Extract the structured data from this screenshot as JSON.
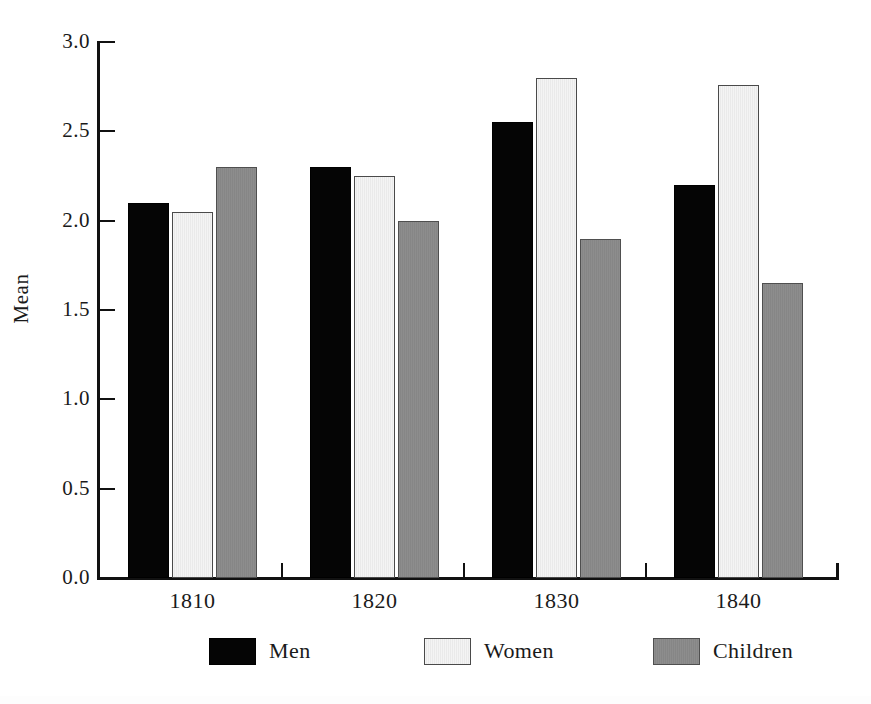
{
  "chart_data": {
    "type": "bar",
    "title": "",
    "subtitle": "",
    "xlabel": "",
    "ylabel": "Mean",
    "categories": [
      "1810",
      "1820",
      "1830",
      "1840"
    ],
    "series": [
      {
        "name": "Men",
        "values": [
          2.1,
          2.3,
          2.55,
          2.2
        ],
        "color": "#050505"
      },
      {
        "name": "Women",
        "values": [
          2.05,
          2.25,
          2.8,
          2.76
        ],
        "color": "#f2f2f2"
      },
      {
        "name": "Children",
        "values": [
          2.3,
          2.0,
          1.9,
          1.65
        ],
        "color": "#8a8a8a"
      }
    ],
    "ylim": [
      0.0,
      3.0
    ],
    "ytick_labels": [
      "0.0",
      "0.5",
      "1.0",
      "1.5",
      "2.0",
      "2.5",
      "3.0"
    ],
    "ytick_values": [
      0.0,
      0.5,
      1.0,
      1.5,
      2.0,
      2.5,
      3.0
    ],
    "grid": false,
    "legend_position": "bottom",
    "legend_entries": [
      "Men",
      "Women",
      "Children"
    ]
  },
  "axis": {
    "y_title": "Mean",
    "ticks": [
      {
        "label": "3.0",
        "value": 3.0
      },
      {
        "label": "2.5",
        "value": 2.5
      },
      {
        "label": "2.0",
        "value": 2.0
      },
      {
        "label": "1.5",
        "value": 1.5
      },
      {
        "label": "1.0",
        "value": 1.0
      },
      {
        "label": "0.5",
        "value": 0.5
      },
      {
        "label": "0.0",
        "value": 0.0
      }
    ],
    "x_labels": [
      "1810",
      "1820",
      "1830",
      "1840"
    ]
  },
  "legend": {
    "items": [
      {
        "label": "Men",
        "key": "men"
      },
      {
        "label": "Women",
        "key": "women"
      },
      {
        "label": "Children",
        "key": "children"
      }
    ]
  }
}
